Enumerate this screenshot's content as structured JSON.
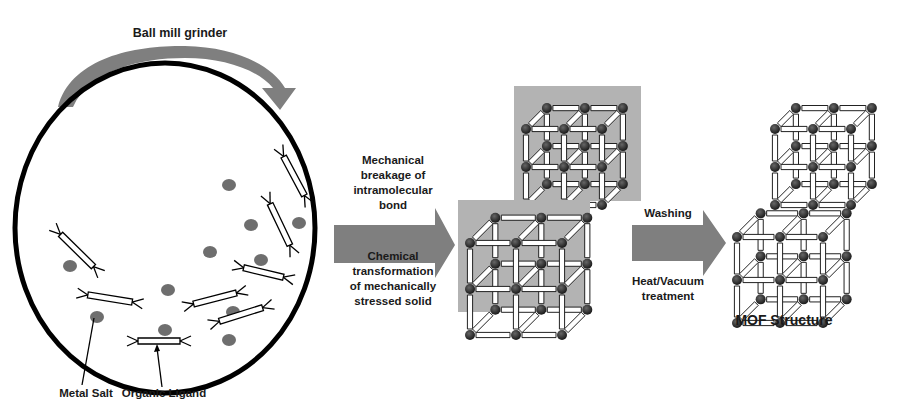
{
  "colors": {
    "arrow_fill": "#7f7f7f",
    "panel_bg": "#b3b3b3",
    "particle": "#6e6e6e",
    "node": "#2a2a2a",
    "outline": "#000000"
  },
  "grinder": {
    "label": "Ball mill grinder",
    "metal_salt_label": "Metal Salt",
    "organic_ligand_label": "Organic Ligand"
  },
  "step1": {
    "top_lines": [
      "Mechanical",
      "breakage of",
      "intramolecular",
      "bond"
    ],
    "bottom_lines": [
      "Chemical",
      "transformation",
      "of mechanically",
      "stressed solid"
    ]
  },
  "step2": {
    "top_lines": [
      "Washing"
    ],
    "bottom_lines": [
      "Heat/Vacuum",
      "treatment"
    ]
  },
  "product": {
    "label": "MOF Structure"
  },
  "legend_items": [
    {
      "name": "metal-salt",
      "icon": "grey-dot"
    },
    {
      "name": "organic-ligand",
      "icon": "double-bar-linker"
    }
  ]
}
